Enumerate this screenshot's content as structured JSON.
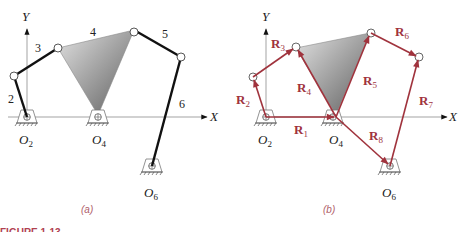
{
  "figure": {
    "caption_fragment": "FIGURE 1-13",
    "colors": {
      "link": "#1a1a1a",
      "vector": "#a0333d",
      "axis": "#999999",
      "panel_label": "#b0606a",
      "ternary_dark": "#6e6e6e",
      "ternary_light": "#d6d6d6"
    }
  },
  "panel_a": {
    "label": "(a)",
    "axes": {
      "x": "X",
      "y": "Y"
    },
    "link_labels": [
      "2",
      "3",
      "4",
      "5",
      "6"
    ],
    "ground_pivots": [
      {
        "name": "O",
        "sub": "2"
      },
      {
        "name": "O",
        "sub": "4"
      },
      {
        "name": "O",
        "sub": "6"
      }
    ]
  },
  "panel_b": {
    "label": "(b)",
    "axes": {
      "x": "X",
      "y": "Y"
    },
    "vectors": [
      {
        "name": "R",
        "sub": "1"
      },
      {
        "name": "R",
        "sub": "2"
      },
      {
        "name": "R",
        "sub": "3"
      },
      {
        "name": "R",
        "sub": "4"
      },
      {
        "name": "R",
        "sub": "5"
      },
      {
        "name": "R",
        "sub": "6"
      },
      {
        "name": "R",
        "sub": "7"
      },
      {
        "name": "R",
        "sub": "8"
      }
    ],
    "ground_pivots": [
      {
        "name": "O",
        "sub": "2"
      },
      {
        "name": "O",
        "sub": "4"
      },
      {
        "name": "O",
        "sub": "6"
      }
    ]
  }
}
